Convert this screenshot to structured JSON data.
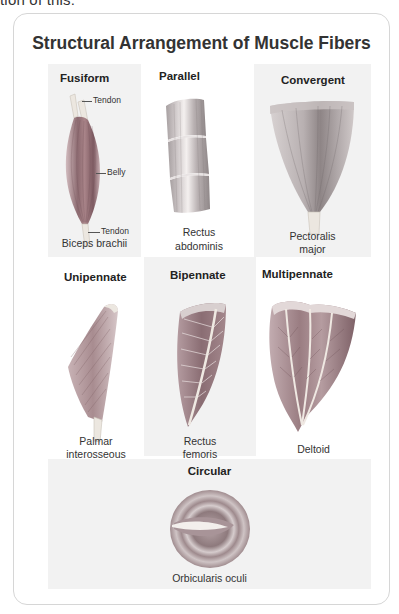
{
  "page": {
    "cut_off_text": "tion of this:"
  },
  "figure": {
    "title": "Structural Arrangement of Muscle Fibers",
    "colors": {
      "card_border": "#d6d6d6",
      "cell_shade": "#f2f2f2",
      "muscle_dark": "#8c6a70",
      "muscle_light": "#d2bcbf",
      "tendon": "#ece7e0"
    },
    "types": [
      {
        "name": "Fusiform",
        "example": "Biceps brachii",
        "annotations": [
          "Tendon",
          "Belly",
          "Tendon"
        ]
      },
      {
        "name": "Parallel",
        "example_line1": "Rectus",
        "example_line2": "abdominis"
      },
      {
        "name": "Convergent",
        "example_line1": "Pectoralis",
        "example_line2": "major"
      },
      {
        "name": "Unipennate",
        "example_line1": "Palmar",
        "example_line2": "interosseous"
      },
      {
        "name": "Bipennate",
        "example_line1": "Rectus",
        "example_line2": "femoris"
      },
      {
        "name": "Multipennate",
        "example": "Deltoid"
      },
      {
        "name": "Circular",
        "example": "Orbicularis oculi"
      }
    ]
  }
}
